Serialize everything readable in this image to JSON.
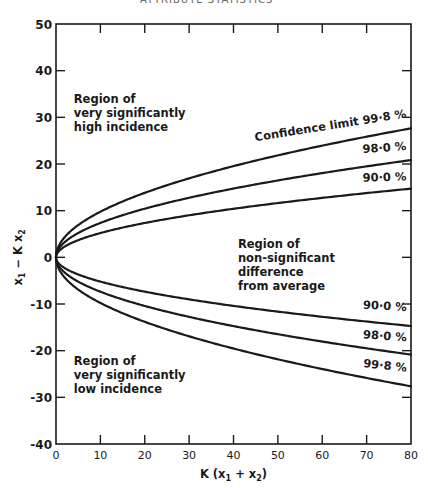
{
  "header_partial": "ATTRIBUTE STATISTICS",
  "chart_data": {
    "type": "line",
    "title": "",
    "xlabel": "K (x1 + x2)",
    "ylabel": "x1 − K x2",
    "xlim": [
      0,
      80
    ],
    "ylim": [
      -40,
      50
    ],
    "x_ticks": [
      0,
      10,
      20,
      30,
      40,
      50,
      60,
      70,
      80
    ],
    "y_ticks": [
      50,
      40,
      30,
      20,
      10,
      0,
      -10,
      -20,
      -30,
      -40
    ],
    "grid": false,
    "legend": null,
    "x": [
      0,
      1,
      2,
      5,
      10,
      15,
      20,
      25,
      30,
      35,
      40,
      45,
      50,
      55,
      60,
      65,
      70,
      75,
      80
    ],
    "series": [
      {
        "name": "Confidence limit 99·8 % (upper)",
        "z": 3.09,
        "values": [
          0,
          3.1,
          4.4,
          6.9,
          9.8,
          12.0,
          13.8,
          15.5,
          16.9,
          18.3,
          19.5,
          20.7,
          21.8,
          22.9,
          23.9,
          24.9,
          25.9,
          26.8,
          27.6
        ]
      },
      {
        "name": "98·0 % (upper)",
        "z": 2.33,
        "values": [
          0,
          2.3,
          3.3,
          5.2,
          7.4,
          9.0,
          10.4,
          11.7,
          12.8,
          13.8,
          14.7,
          15.6,
          16.5,
          17.3,
          18.0,
          18.8,
          19.5,
          20.2,
          20.8
        ]
      },
      {
        "name": "90·0 % (upper)",
        "z": 1.645,
        "values": [
          0,
          1.6,
          2.3,
          3.7,
          5.2,
          6.4,
          7.4,
          8.2,
          9.0,
          9.7,
          10.4,
          11.0,
          11.6,
          12.2,
          12.7,
          13.3,
          13.8,
          14.2,
          14.7
        ]
      },
      {
        "name": "90·0 % (lower)",
        "z": -1.645,
        "values": [
          0,
          -1.6,
          -2.3,
          -3.7,
          -5.2,
          -6.4,
          -7.4,
          -8.2,
          -9.0,
          -9.7,
          -10.4,
          -11.0,
          -11.6,
          -12.2,
          -12.7,
          -13.3,
          -13.8,
          -14.2,
          -14.7
        ]
      },
      {
        "name": "98·0 % (lower)",
        "z": -2.33,
        "values": [
          0,
          -2.3,
          -3.3,
          -5.2,
          -7.4,
          -9.0,
          -10.4,
          -11.7,
          -12.8,
          -13.8,
          -14.7,
          -15.6,
          -16.5,
          -17.3,
          -18.0,
          -18.8,
          -19.5,
          -20.2,
          -20.8
        ]
      },
      {
        "name": "99·8 % (lower)",
        "z": -3.09,
        "values": [
          0,
          -3.1,
          -4.4,
          -6.9,
          -9.8,
          -12.0,
          -13.8,
          -15.5,
          -16.9,
          -18.3,
          -19.5,
          -20.7,
          -21.8,
          -22.9,
          -23.9,
          -24.9,
          -25.9,
          -26.8,
          -27.6
        ]
      }
    ],
    "curve_labels": [
      {
        "text": "Confidence limit 99·8 %",
        "x": 67,
        "y": 30,
        "rotate": -9
      },
      {
        "text": "98·0 %",
        "x": 72,
        "y": 23,
        "rotate": -4
      },
      {
        "text": "90·0 %",
        "x": 72,
        "y": 16.5,
        "rotate": -2
      },
      {
        "text": "90·0 %",
        "x": 72,
        "y": -11.5,
        "rotate": 3
      },
      {
        "text": "98·0 %",
        "x": 72,
        "y": -18,
        "rotate": 4
      },
      {
        "text": "99·8 %",
        "x": 72,
        "y": -24.5,
        "rotate": 6
      }
    ],
    "annotations": [
      {
        "lines": [
          "Region of",
          "very significantly",
          "high incidence"
        ],
        "x": 4,
        "y": 33
      },
      {
        "lines": [
          "Region of",
          "non-significant",
          "difference",
          "from average"
        ],
        "x": 41,
        "y": 2
      },
      {
        "lines": [
          "Region of",
          "very significantly",
          "low incidence"
        ],
        "x": 4,
        "y": -23
      }
    ]
  }
}
